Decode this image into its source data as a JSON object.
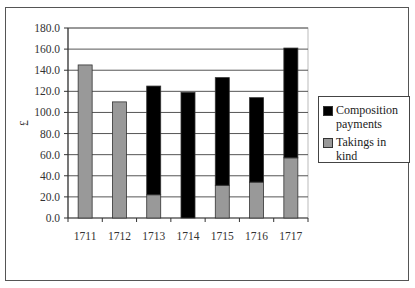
{
  "chart_data": {
    "type": "bar",
    "stacked": true,
    "title": "",
    "xlabel": "",
    "ylabel": "£",
    "ylim": [
      0,
      180
    ],
    "yticks": [
      "0.0",
      "20.0",
      "40.0",
      "60.0",
      "80.0",
      "100.0",
      "120.0",
      "140.0",
      "160.0",
      "180.0"
    ],
    "grid": true,
    "legend_position": "right",
    "categories": [
      "1711",
      "1712",
      "1713",
      "1714",
      "1715",
      "1716",
      "1717"
    ],
    "series": [
      {
        "name": "Takings in kind",
        "color": "#999999",
        "values": [
          145,
          110,
          22,
          0,
          31,
          34,
          57
        ]
      },
      {
        "name": "Composition payments",
        "color": "#000000",
        "values": [
          0,
          0,
          103,
          119,
          102,
          80,
          104
        ]
      }
    ]
  },
  "legend": {
    "items": [
      {
        "label": "Composition payments",
        "color": "#000000"
      },
      {
        "label": "Takings in kind",
        "color": "#999999"
      }
    ]
  },
  "axis": {
    "ylabel": "£"
  }
}
